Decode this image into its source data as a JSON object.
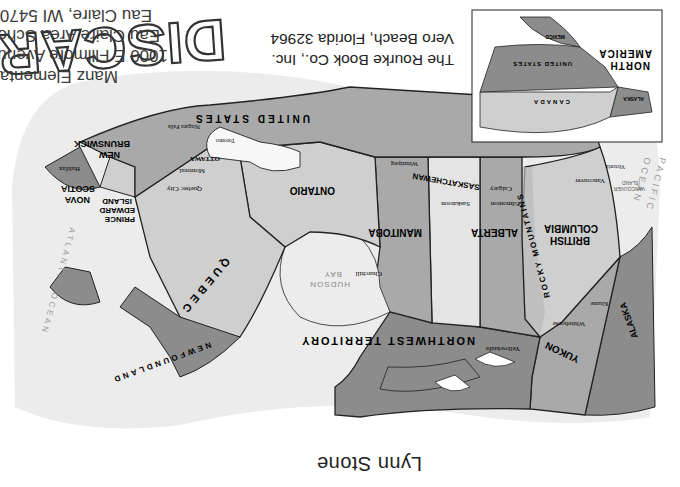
{
  "page": {
    "orientation": "rotated 180 degrees",
    "author": "Lynn Stone",
    "publisher_line1": "The Rourke Book Co., Inc.",
    "publisher_line2": "Vero Beach, Florida 32964"
  },
  "stamp": {
    "discard_label": "DISCARD",
    "line1": "Manz Elementary",
    "line2": "1000 E Fillmore Avenue",
    "line3": "Eau Claire Area Schools",
    "line4": "Eau Claire, WI 54701"
  },
  "inset": {
    "title_line1": "NORTH",
    "title_line2": "AMERICA",
    "labels": {
      "canada": "CANADA",
      "us": "UNITED STATES",
      "mexico": "MEXICO",
      "alaska": "ALASKA"
    }
  },
  "map": {
    "colors": {
      "dark_region": "#8c8c8c",
      "medium_region": "#a9a9a9",
      "light_region": "#cfcfcf",
      "very_light": "#e4e4e4",
      "water": "#ececec",
      "background": "#ffffff"
    },
    "regions": {
      "alaska": "ALASKA",
      "yukon": "YUKON",
      "nwt": "NORTHWEST TERRITORY",
      "bc_1": "BRITISH",
      "bc_2": "COLUMBIA",
      "rockies": "ROCKY MOUNTAINS",
      "alberta": "ALBERTA",
      "saskatchewan": "SASKATCHEWAN",
      "manitoba": "MANITOBA",
      "ontario": "ONTARIO",
      "quebec": "QUEBEC",
      "newfoundland": "NEWFOUNDLAND",
      "nb_1": "NEW",
      "nb_2": "BRUNSWICK",
      "ns_1": "NOVA",
      "ns_2": "SCOTIA",
      "pei_1": "PRINCE",
      "pei_2": "EDWARD",
      "pei_3": "ISLAND",
      "us": "UNITED STATES",
      "hudson_1": "HUDSON",
      "hudson_2": "BAY",
      "pacific_1": "PACIFIC",
      "pacific_2": "OCEAN",
      "atlantic": "ATLANTIC OCEAN",
      "vancouver_island_1": "VANCOUVER",
      "vancouver_island_2": "ISLAND"
    },
    "cities": {
      "whitehorse": "Whitehorse",
      "kluane": "Kluane",
      "yellowknife": "Yellowknife",
      "vancouver": "Vancouver",
      "victoria": "Victoria",
      "edmonton": "Edmonton",
      "calgary": "Calgary",
      "saskatoon": "Saskatoon",
      "winnipeg": "Winnipeg",
      "churchill": "Churchill",
      "ottawa": "OTTAWA",
      "montreal": "Montreal",
      "quebec_city": "Quebec City",
      "toronto": "Toronto",
      "niagara": "Niagara Falls",
      "halifax": "Halifax"
    }
  }
}
